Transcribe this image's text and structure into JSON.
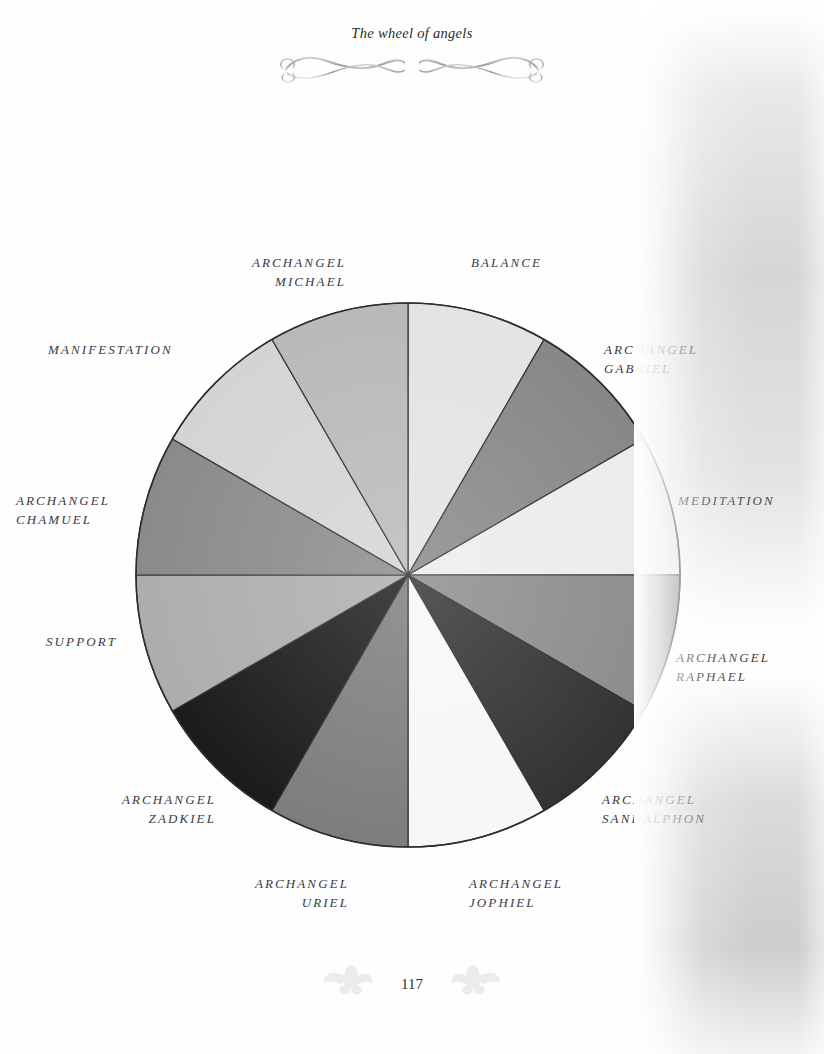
{
  "header": {
    "title": "The wheel of angels",
    "ornament_icon": "flourish-divider-icon"
  },
  "footer": {
    "page_number": "117",
    "left_ornament_icon": "cherub-icon",
    "right_ornament_icon": "cherub-icon"
  },
  "wheel": {
    "name": "wheel-of-angels",
    "center": {
      "x": 408,
      "y": 575
    },
    "radius": 272,
    "segment_count": 12,
    "segment_degrees": 30,
    "stroke_color": "#2e2e2e",
    "labels": [
      {
        "id": "balance",
        "text": "BALANCE"
      },
      {
        "id": "archangel-gabriel",
        "text": "ARCHANGEL\nGABRIEL"
      },
      {
        "id": "meditation",
        "text": "MEDITATION"
      },
      {
        "id": "archangel-raphael",
        "text": "ARCHANGEL\nRAPHAEL"
      },
      {
        "id": "archangel-sandalphon",
        "text": "ARCHANGEL\nSANDALPHON"
      },
      {
        "id": "archangel-jophiel",
        "text": "ARCHANGEL\nJOPHIEL"
      },
      {
        "id": "archangel-uriel",
        "text": "ARCHANGEL\nURIEL"
      },
      {
        "id": "archangel-zadkiel",
        "text": "ARCHANGEL\nZADKIEL"
      },
      {
        "id": "support",
        "text": "SUPPORT"
      },
      {
        "id": "archangel-chamuel",
        "text": "ARCHANGEL\nCHAMUEL"
      },
      {
        "id": "manifestation",
        "text": "MANIFESTATION"
      },
      {
        "id": "archangel-michael",
        "text": "ARCHANGEL\nMICHAEL"
      }
    ]
  },
  "chart_data": {
    "type": "pie",
    "title": "The wheel of angels",
    "xlabel": "",
    "ylabel": "",
    "legend_position": "around-perimeter",
    "grid": false,
    "categories": [
      "BALANCE",
      "ARCHANGEL GABRIEL",
      "MEDITATION",
      "ARCHANGEL RAPHAEL",
      "ARCHANGEL SANDALPHON",
      "ARCHANGEL JOPHIEL",
      "ARCHANGEL URIEL",
      "ARCHANGEL ZADKIEL",
      "SUPPORT",
      "ARCHANGEL CHAMUEL",
      "MANIFESTATION",
      "ARCHANGEL MICHAEL"
    ],
    "values": [
      30,
      30,
      30,
      30,
      30,
      30,
      30,
      30,
      30,
      30,
      30,
      30
    ],
    "value_unit": "degrees",
    "slice_colors": [
      "#e3e3e3",
      "#878787",
      "#ececec",
      "#8c8c8c",
      "#333333",
      "#f7f7f7",
      "#7d7d7d",
      "#1b1b1b",
      "#adadad",
      "#8a8a8a",
      "#d4d4d4",
      "#b9b9b9"
    ],
    "slice_start_angles_deg": [
      0,
      30,
      60,
      90,
      120,
      150,
      180,
      210,
      240,
      270,
      300,
      330
    ]
  }
}
